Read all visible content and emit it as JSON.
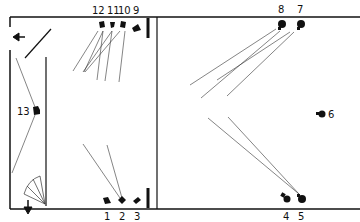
{
  "diagram": {
    "type": "stage-lighting-plan",
    "colors": {
      "ink": "#111111",
      "paper": "#ffffff",
      "beam": "#333333"
    },
    "labels": {
      "l1": "1",
      "l2": "2",
      "l3": "3",
      "l4": "4",
      "l5": "5",
      "l6": "6",
      "l7": "7",
      "l8": "8",
      "l9": "9",
      "l10": "10",
      "l11": "11",
      "l12": "12",
      "l13": "13"
    },
    "lights": [
      {
        "id": "1",
        "x": 106,
        "y": 200
      },
      {
        "id": "2",
        "x": 122,
        "y": 200
      },
      {
        "id": "3",
        "x": 137,
        "y": 199
      },
      {
        "id": "4",
        "x": 285,
        "y": 198
      },
      {
        "id": "5",
        "x": 301,
        "y": 198
      },
      {
        "id": "6",
        "x": 323,
        "y": 113
      },
      {
        "id": "7",
        "x": 300,
        "y": 25
      },
      {
        "id": "8",
        "x": 281,
        "y": 25
      },
      {
        "id": "9",
        "x": 136,
        "y": 28
      },
      {
        "id": "10",
        "x": 123,
        "y": 25
      },
      {
        "id": "11",
        "x": 112,
        "y": 25
      },
      {
        "id": "12",
        "x": 101,
        "y": 25
      },
      {
        "id": "13",
        "x": 37,
        "y": 111
      }
    ],
    "arrows": [
      {
        "name": "exit-left-arrow",
        "direction": "left"
      },
      {
        "name": "exit-down-arrow",
        "direction": "down"
      }
    ]
  }
}
